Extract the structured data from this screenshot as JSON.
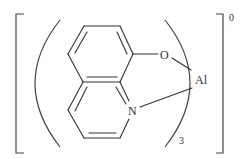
{
  "diagram": {
    "type": "chemical-structure",
    "compound_depicted": "tris(8-hydroxyquinolinato)aluminium",
    "atoms": {
      "oxygen": "O",
      "nitrogen": "N",
      "metal": "Al"
    },
    "ligand_count_subscript": "3",
    "charge_superscript": "0",
    "colors": {
      "line": "#333333",
      "background": "#ffffff"
    }
  }
}
